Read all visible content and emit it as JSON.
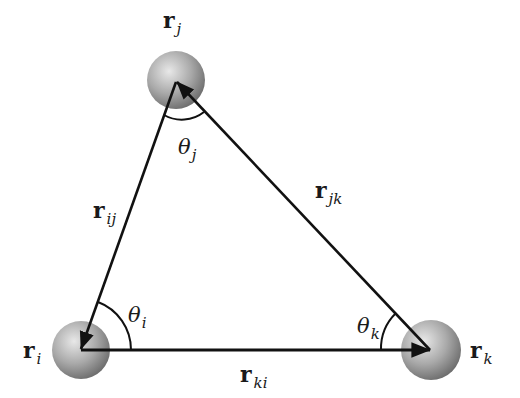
{
  "diagram": {
    "type": "three-body angle diagram",
    "colors": {
      "line": "#111111",
      "sphere_light": "#e6e6e6",
      "sphere_mid": "#a8a8a8",
      "sphere_dark": "#6e6e6e",
      "background": "#ffffff"
    },
    "atoms": [
      {
        "id": "i",
        "label": "r",
        "subscript": "i",
        "cx": 81,
        "cy": 350
      },
      {
        "id": "j",
        "label": "r",
        "subscript": "j",
        "cx": 176,
        "cy": 80
      },
      {
        "id": "k",
        "label": "r",
        "subscript": "k",
        "cx": 431,
        "cy": 350
      }
    ],
    "vectors": [
      {
        "id": "ij",
        "label": "r",
        "subscript": "ij",
        "from": "j",
        "to": "i"
      },
      {
        "id": "jk",
        "label": "r",
        "subscript": "jk",
        "from": "k",
        "to": "j"
      },
      {
        "id": "ki",
        "label": "r",
        "subscript": "ki",
        "from": "i",
        "to": "k"
      }
    ],
    "angles": [
      {
        "id": "theta_i",
        "symbol": "θ",
        "subscript": "i",
        "at": "i"
      },
      {
        "id": "theta_j",
        "symbol": "θ",
        "subscript": "j",
        "at": "j"
      },
      {
        "id": "theta_k",
        "symbol": "θ",
        "subscript": "k",
        "at": "k"
      }
    ]
  }
}
